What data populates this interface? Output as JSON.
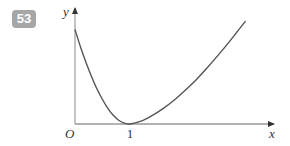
{
  "question_number": "53",
  "chart_data": {
    "type": "line",
    "title": "",
    "xlabel": "x",
    "ylabel": "y",
    "origin_label": "O",
    "x_ticks": [
      {
        "value": 1,
        "label": "1"
      }
    ],
    "xlim": [
      0,
      3.3
    ],
    "ylim": [
      0,
      1.55
    ],
    "grid": false,
    "series": [
      {
        "name": "curve",
        "color": "#555555",
        "x": [
          0,
          0.1,
          0.2,
          0.3,
          0.4,
          0.5,
          0.6,
          0.7,
          0.8,
          0.9,
          1.0,
          1.2,
          1.4,
          1.6,
          1.8,
          2.0,
          2.2,
          2.4,
          2.6,
          2.8,
          3.0,
          3.1
        ],
        "y": [
          1.35,
          1.1,
          0.88,
          0.68,
          0.5,
          0.35,
          0.22,
          0.12,
          0.05,
          0.012,
          0,
          0.04,
          0.12,
          0.22,
          0.34,
          0.48,
          0.63,
          0.8,
          0.98,
          1.17,
          1.37,
          1.47
        ]
      }
    ]
  }
}
